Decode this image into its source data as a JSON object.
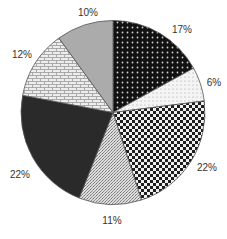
{
  "chart_data": {
    "type": "pie",
    "title": "",
    "start_angle_deg": 0,
    "direction": "clockwise",
    "slices": [
      {
        "label": "17%",
        "value": 17,
        "pattern": "dark-dots",
        "fill": "#1a1a1a"
      },
      {
        "label": "6%",
        "value": 6,
        "pattern": "light-dots",
        "fill": "#f2f2f2"
      },
      {
        "label": "22%",
        "value": 22,
        "pattern": "checker",
        "fill": "#555555"
      },
      {
        "label": "11%",
        "value": 11,
        "pattern": "stipple",
        "fill": "#c8c8c8"
      },
      {
        "label": "22%",
        "value": 22,
        "pattern": "solid-dark",
        "fill": "#2b2b2b"
      },
      {
        "label": "12%",
        "value": 12,
        "pattern": "brick",
        "fill": "#e6e6e6"
      },
      {
        "label": "10%",
        "value": 10,
        "pattern": "solid-gray",
        "fill": "#a9a9a9"
      }
    ],
    "legend": null,
    "label_positions": [
      {
        "x": 182,
        "y": 29
      },
      {
        "x": 214,
        "y": 82
      },
      {
        "x": 207,
        "y": 167
      },
      {
        "x": 112,
        "y": 220
      },
      {
        "x": 20,
        "y": 174
      },
      {
        "x": 22,
        "y": 54
      },
      {
        "x": 88,
        "y": 12
      }
    ]
  }
}
